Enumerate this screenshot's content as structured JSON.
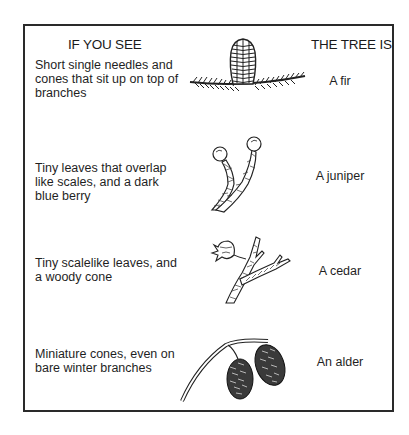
{
  "headers": {
    "left": "IF YOU SEE",
    "right": "THE TREE IS"
  },
  "rows": [
    {
      "description": "Short single needles and cones that sit up on top of branches",
      "tree": "A fir",
      "illustration": "fir-cone-on-branch"
    },
    {
      "description": "Tiny leaves that overlap like scales, and a dark blue berry",
      "tree": "A juniper",
      "illustration": "juniper-sprig-with-berries"
    },
    {
      "description": "Tiny scalelike leaves, and a woody cone",
      "tree": "A cedar",
      "illustration": "cedar-sprig-with-cone"
    },
    {
      "description": "Miniature cones, even on bare winter branches",
      "tree": "An alder",
      "illustration": "alder-twig-with-cones"
    }
  ]
}
